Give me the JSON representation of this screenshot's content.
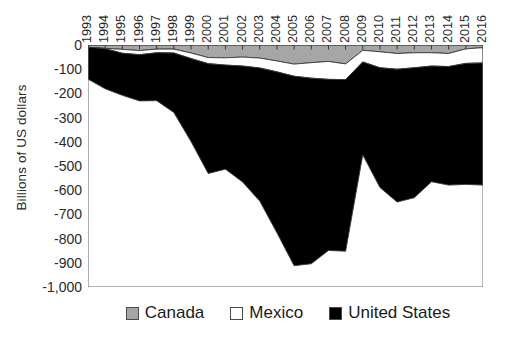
{
  "chart_data": {
    "type": "area",
    "stacked": true,
    "title": "",
    "xlabel": "",
    "ylabel": "Billions of US dollars",
    "ylim": [
      -1000,
      0
    ],
    "ytick_labels": [
      "0",
      "-100",
      "-200",
      "-300",
      "-400",
      "-500",
      "-600",
      "-700",
      "-800",
      "-900",
      "-1,000"
    ],
    "ytick_values": [
      0,
      -100,
      -200,
      -300,
      -400,
      -500,
      -600,
      -700,
      -800,
      -900,
      -1000
    ],
    "grid": false,
    "legend_position": "bottom",
    "categories": [
      "1993",
      "1994",
      "1995",
      "1996",
      "1997",
      "1998",
      "1999",
      "2000",
      "2001",
      "2002",
      "2003",
      "2004",
      "2005",
      "2006",
      "2007",
      "2008",
      "2009",
      "2010",
      "2011",
      "2012",
      "2013",
      "2014",
      "2015",
      "2016"
    ],
    "series": [
      {
        "name": "Canada",
        "color": "#a6a6a6",
        "values": [
          -11,
          -14,
          -18,
          -23,
          -17,
          -17,
          -33,
          -52,
          -53,
          -50,
          -54,
          -66,
          -79,
          -73,
          -68,
          -78,
          -22,
          -28,
          -35,
          -32,
          -32,
          -35,
          -16,
          -11
        ]
      },
      {
        "name": "Mexico",
        "color": "#ffffff",
        "values": [
          2,
          -1,
          -16,
          -17,
          -15,
          -16,
          -23,
          -25,
          -30,
          -37,
          -41,
          -45,
          -50,
          -64,
          -74,
          -65,
          -48,
          -66,
          -65,
          -62,
          -55,
          -54,
          -60,
          -63
        ]
      },
      {
        "name": "United States",
        "color": "#000000",
        "values": [
          -132,
          -166,
          -174,
          -191,
          -198,
          -246,
          -343,
          -454,
          -430,
          -479,
          -550,
          -665,
          -783,
          -767,
          -707,
          -709,
          -384,
          -495,
          -549,
          -537,
          -478,
          -490,
          -500,
          -505
        ]
      }
    ],
    "series_totals": [
      -141,
      -181,
      -208,
      -231,
      -230,
      -279,
      -399,
      -531,
      -513,
      -566,
      -645,
      -776,
      -912,
      -904,
      -849,
      -852,
      -454,
      -589,
      -649,
      -631,
      -565,
      -579,
      -576,
      -579
    ]
  },
  "legend": {
    "items": [
      {
        "label": "Canada",
        "swatch": "canada-swatch"
      },
      {
        "label": "Mexico",
        "swatch": "mexico-swatch"
      },
      {
        "label": "United States",
        "swatch": "united-states-swatch"
      }
    ]
  }
}
